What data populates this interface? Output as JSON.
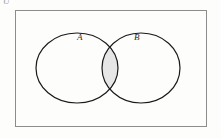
{
  "figure": {
    "kind": "venn-diagram",
    "background_color": "#fdfdfc",
    "universe": {
      "label": "U",
      "label_color": "#9a9a9a",
      "border_color": "#8c8c8c",
      "fill_color": "#fdfdfc",
      "rect": {
        "x": 15,
        "y": 10,
        "width": 192,
        "height": 117
      }
    },
    "sets": [
      {
        "id": "A",
        "label": "A",
        "outline_color": "#1a1a1a",
        "fill_color": "none",
        "ellipse": {
          "cx": 77,
          "cy": 68,
          "rx": 41,
          "ry": 35
        }
      },
      {
        "id": "B",
        "label": "B",
        "outline_color": "#1a1a1a",
        "fill_color": "none",
        "ellipse": {
          "cx": 141,
          "cy": 68,
          "rx": 39,
          "ry": 35
        }
      }
    ],
    "intersection": {
      "label": "A intersect B",
      "shaded": true,
      "fill_color": "#e6e6e6",
      "stroke_color": "#1a1a1a"
    }
  }
}
